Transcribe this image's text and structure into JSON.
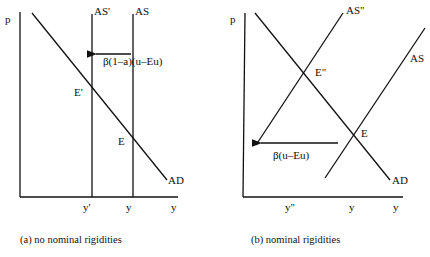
{
  "panel_a": {
    "caption": "(a) no nominal rigidities",
    "axis_y_label": "p",
    "axis_x_label": "y",
    "curves": {
      "ad": "AD",
      "as": "AS",
      "as_shift": "AS'"
    },
    "points": {
      "e": "E",
      "e_shift": "E'"
    },
    "ticks": {
      "y_shift": "y'",
      "y": "y"
    },
    "shift_label": "β(1–a)(u–Eu)"
  },
  "panel_b": {
    "caption": "(b) nominal rigidities",
    "axis_y_label": "p",
    "axis_x_label": "y",
    "curves": {
      "ad": "AD",
      "as": "AS",
      "as_shift": "AS\""
    },
    "points": {
      "e": "E",
      "e_shift": "E\""
    },
    "ticks": {
      "y_shift": "y\"",
      "y": "y"
    },
    "shift_label": "β(u–Eu)"
  },
  "colors": {
    "ink": "#111111",
    "background": "#ffffff"
  }
}
